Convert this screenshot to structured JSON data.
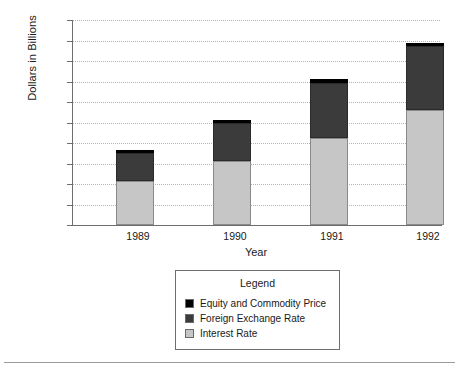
{
  "chart_data": {
    "type": "bar",
    "subtype": "stacked-bar",
    "title": "",
    "xlabel": "Year",
    "ylabel": "Dollars in Billions",
    "categories": [
      "1989",
      "1990",
      "1991",
      "1992"
    ],
    "ylim": [
      0,
      20000
    ],
    "ytick_labels": [
      "0",
      "2000",
      "4000",
      "6000",
      "8000",
      "10000",
      "12000",
      "14000",
      "16000",
      "18000",
      "20000"
    ],
    "ytick_values": [
      0,
      2000,
      4000,
      6000,
      8000,
      10000,
      12000,
      14000,
      16000,
      18000,
      20000
    ],
    "grid": true,
    "grid_style": "dotted",
    "legend_position": "below-center",
    "legend_title": "Legend",
    "series": [
      {
        "name": "Interest Rate",
        "color": "#c6c6c6",
        "values": [
          4300,
          6200,
          8500,
          11200
        ]
      },
      {
        "name": "Foreign Exchange Rate",
        "color": "#3b3b3b",
        "values": [
          2700,
          3800,
          5400,
          6300
        ]
      },
      {
        "name": "Equity and Commodity Price",
        "color": "#000000",
        "values": [
          300,
          250,
          300,
          300
        ]
      }
    ],
    "stack_order_bottom_to_top": [
      "Interest Rate",
      "Foreign Exchange Rate",
      "Equity and Commodity Price"
    ],
    "totals": [
      7300,
      10250,
      14200,
      17800
    ]
  },
  "legend": {
    "title": "Legend",
    "entries": [
      {
        "label": "Equity and Commodity Price",
        "color": "#000000"
      },
      {
        "label": "Foreign Exchange Rate",
        "color": "#3b3b3b"
      },
      {
        "label": "Interest Rate",
        "color": "#c6c6c6"
      }
    ]
  },
  "axes": {
    "y_title": "Dollars in Billions",
    "x_title": "Year"
  }
}
